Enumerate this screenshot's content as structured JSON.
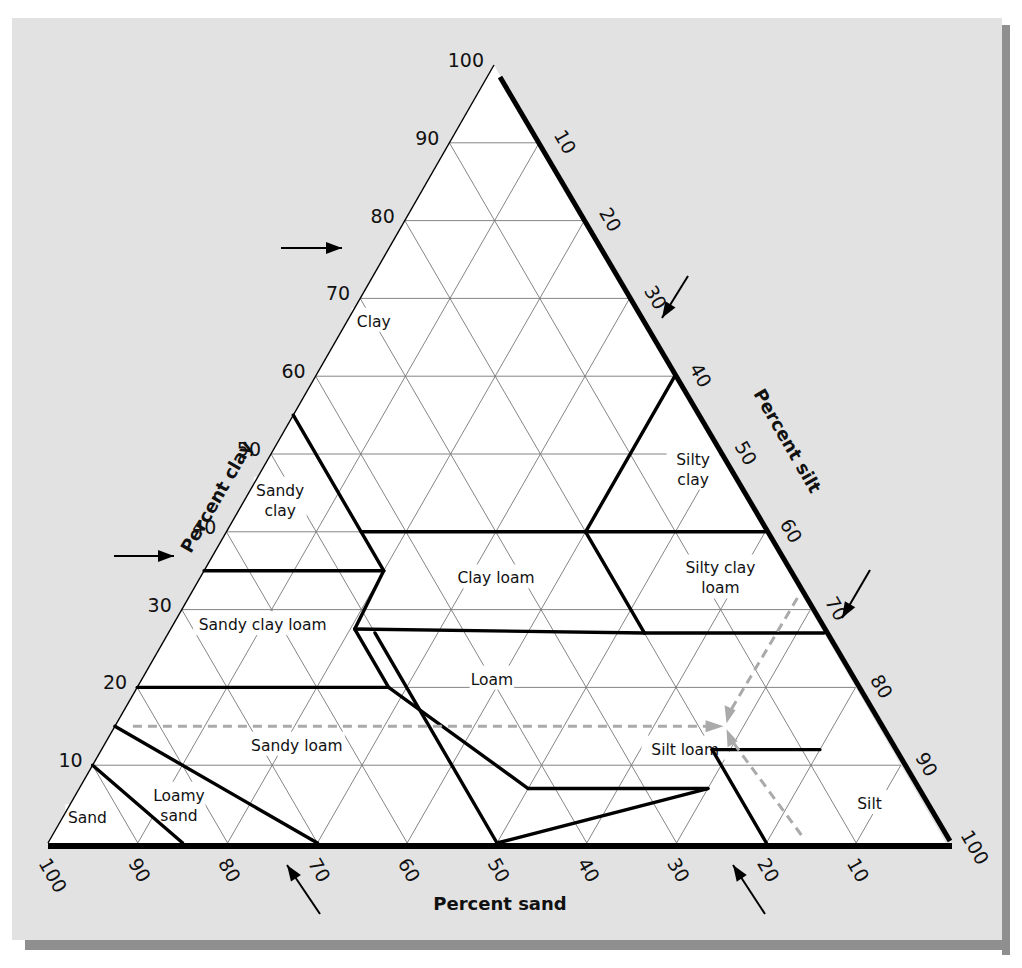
{
  "chart_data": {
    "type": "ternary",
    "title": "",
    "axes": {
      "clay": {
        "label": "Percent clay",
        "side": "left",
        "ticks": [
          10,
          20,
          30,
          40,
          50,
          60,
          70,
          80,
          90,
          100
        ]
      },
      "silt": {
        "label": "Percent silt",
        "side": "right",
        "ticks": [
          10,
          20,
          30,
          40,
          50,
          60,
          70,
          80,
          90,
          100
        ]
      },
      "sand": {
        "label": "Percent sand",
        "side": "bottom",
        "ticks": [
          100,
          90,
          80,
          70,
          60,
          50,
          40,
          30,
          20,
          10
        ]
      }
    },
    "grid": {
      "on": true,
      "interval": 10
    },
    "regions": [
      {
        "name": "Clay",
        "label_lines": [
          "Clay"
        ],
        "label_pos": {
          "sand": 30,
          "clay": 67
        }
      },
      {
        "name": "Sandy clay",
        "label_lines": [
          "Sandy",
          "clay"
        ],
        "label_pos": {
          "sand": 52,
          "clay": 44
        }
      },
      {
        "name": "Silty clay",
        "label_lines": [
          "Silty",
          "clay"
        ],
        "label_pos": {
          "sand": 4,
          "clay": 48
        }
      },
      {
        "name": "Clay loam",
        "label_lines": [
          "Clay loam"
        ],
        "label_pos": {
          "sand": 33,
          "clay": 34
        }
      },
      {
        "name": "Silty clay loam",
        "label_lines": [
          "Silty clay",
          "loam"
        ],
        "label_pos": {
          "sand": 8,
          "clay": 34
        }
      },
      {
        "name": "Sandy clay loam",
        "label_lines": [
          "Sandy clay loam"
        ],
        "label_pos": {
          "sand": 62,
          "clay": 28
        }
      },
      {
        "name": "Loam",
        "label_lines": [
          "Loam"
        ],
        "label_pos": {
          "sand": 40,
          "clay": 21
        }
      },
      {
        "name": "Silt loam",
        "label_lines": [
          "Silt loam"
        ],
        "label_pos": {
          "sand": 23,
          "clay": 12
        }
      },
      {
        "name": "Sandy loam",
        "label_lines": [
          "Sandy loam"
        ],
        "label_pos": {
          "sand": 66,
          "clay": 12.5
        }
      },
      {
        "name": "Loamy sand",
        "label_lines": [
          "Loamy",
          "sand"
        ],
        "label_pos": {
          "sand": 83,
          "clay": 4.8
        }
      },
      {
        "name": "Sand",
        "label_lines": [
          "Sand"
        ],
        "label_pos": {
          "sand": 94,
          "clay": 3.2
        }
      },
      {
        "name": "Silt",
        "label_lines": [
          "Silt"
        ],
        "label_pos": {
          "sand": 6,
          "clay": 5
        }
      }
    ],
    "boundaries": [
      [
        [
          45,
          55
        ],
        [
          45,
          35
        ]
      ],
      [
        [
          45,
          35
        ],
        [
          52,
          27.5
        ]
      ],
      [
        [
          52,
          27.5
        ],
        [
          52,
          20
        ]
      ],
      [
        [
          52,
          20
        ],
        [
          43,
          7
        ]
      ],
      [
        [
          43,
          7
        ],
        [
          23,
          7
        ]
      ],
      [
        [
          23,
          7
        ],
        [
          50,
          0
        ]
      ],
      [
        [
          65,
          35
        ],
        [
          45,
          35
        ]
      ],
      [
        [
          80,
          20
        ],
        [
          52,
          20
        ]
      ],
      [
        [
          45,
          40
        ],
        [
          20,
          40
        ]
      ],
      [
        [
          20,
          40
        ],
        [
          0,
          60
        ]
      ],
      [
        [
          20,
          40
        ],
        [
          0,
          40
        ]
      ],
      [
        [
          20,
          40
        ],
        [
          20,
          27
        ]
      ],
      [
        [
          52,
          27.5
        ],
        [
          20,
          27
        ]
      ],
      [
        [
          20,
          27
        ],
        [
          0,
          27
        ]
      ],
      [
        [
          50,
          27
        ],
        [
          50,
          0
        ]
      ],
      [
        [
          20,
          12
        ],
        [
          8,
          12
        ]
      ],
      [
        [
          20,
          12
        ],
        [
          20,
          0
        ]
      ],
      [
        [
          85,
          15
        ],
        [
          70,
          0
        ]
      ],
      [
        [
          90,
          10
        ],
        [
          85,
          0
        ]
      ]
    ],
    "example_point": {
      "sand": 17,
      "clay": 15,
      "silt": 68,
      "texture": "Silt loam"
    },
    "annotations": [
      {
        "type": "arrow",
        "target": "clay ~75",
        "side": "left"
      },
      {
        "type": "arrow",
        "target": "clay ~35",
        "side": "left"
      },
      {
        "type": "arrow",
        "target": "silt ~35",
        "side": "right"
      },
      {
        "type": "arrow",
        "target": "silt ~75",
        "side": "right"
      },
      {
        "type": "arrow",
        "target": "sand ~75",
        "side": "bottom"
      },
      {
        "type": "arrow",
        "target": "sand ~25",
        "side": "bottom"
      }
    ]
  },
  "labels": {
    "clay_axis": "Percent clay",
    "silt_axis": "Percent silt",
    "sand_axis": "Percent sand"
  }
}
